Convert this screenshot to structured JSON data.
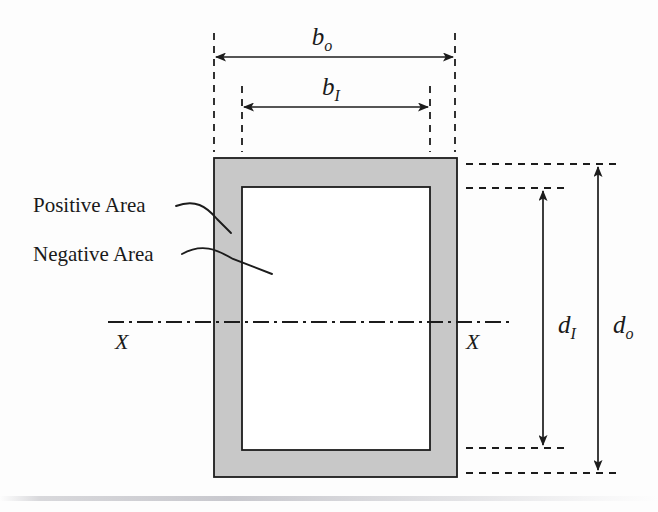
{
  "figure": {
    "callouts": [
      {
        "id": "positive-area",
        "label": "Positive Area"
      },
      {
        "id": "negative-area",
        "label": "Negative Area"
      }
    ],
    "dimensions": [
      {
        "id": "b-outer",
        "symbol": "b",
        "subscript": "o",
        "orientation": "horizontal",
        "measures": "outer width"
      },
      {
        "id": "b-inner",
        "symbol": "b",
        "subscript": "I",
        "orientation": "horizontal",
        "measures": "inner width"
      },
      {
        "id": "d-inner",
        "symbol": "d",
        "subscript": "I",
        "orientation": "vertical",
        "measures": "inner depth"
      },
      {
        "id": "d-outer",
        "symbol": "d",
        "subscript": "o",
        "orientation": "vertical",
        "measures": "outer depth"
      }
    ],
    "axis": {
      "label_left": "X",
      "label_right": "X",
      "style": "dash-dot centerline"
    },
    "colors": {
      "positive_area_fill": "#c8c8c8",
      "negative_area_fill": "#ffffff",
      "line": "#1c1c1c",
      "background": "#fdfdfd"
    },
    "geometry": {
      "outer_left": 214,
      "outer_right": 457,
      "outer_top": 158,
      "outer_bottom": 477,
      "inner_left": 242,
      "inner_right": 430,
      "inner_top": 187,
      "inner_bottom": 450,
      "axis_y": 322
    }
  }
}
